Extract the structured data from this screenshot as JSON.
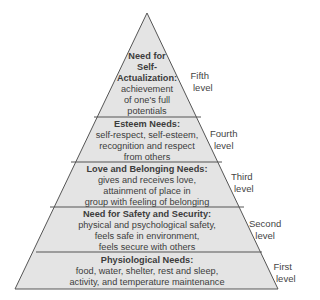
{
  "diagram": {
    "type": "pyramid",
    "colors": {
      "fill": "#e4e4e4",
      "stroke": "#555555",
      "text": "#3c3c3c"
    },
    "tiers": [
      {
        "heading": "Need for Self-Actualization:",
        "heading_lines": [
          "Need for",
          "Self-",
          "Actualization:"
        ],
        "body_lines": [
          "achievement",
          "of one's full",
          "potentials"
        ],
        "level_lines": [
          "Fifth",
          "level"
        ]
      },
      {
        "heading": "Esteem Needs:",
        "heading_lines": [
          "Esteem Needs:"
        ],
        "body_lines": [
          "self-respect, self-esteem,",
          "recognition and respect",
          "from others"
        ],
        "level_lines": [
          "Fourth",
          "level"
        ]
      },
      {
        "heading": "Love and Belonging Needs:",
        "heading_lines": [
          "Love and Belonging Needs:"
        ],
        "body_lines": [
          "gives and receives love,",
          "attainment of place in",
          "group with feeling of belonging"
        ],
        "level_lines": [
          "Third",
          "level"
        ]
      },
      {
        "heading": "Need for Safety and Security:",
        "heading_lines": [
          "Need for Safety and Security:"
        ],
        "body_lines": [
          "physical and psychological safety,",
          "feels safe in environment,",
          "feels secure with others"
        ],
        "level_lines": [
          "Second",
          "level"
        ]
      },
      {
        "heading": "Physiological Needs:",
        "heading_lines": [
          "Physiological Needs:"
        ],
        "body_lines": [
          "food, water, shelter, rest and sleep,",
          "activity, and temperature maintenance"
        ],
        "level_lines": [
          "First",
          "level"
        ]
      }
    ]
  }
}
